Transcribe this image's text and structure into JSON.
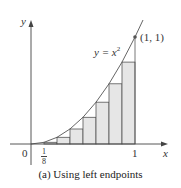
{
  "figure": {
    "function_label": "y = x",
    "exponent": "2",
    "point_label": "(1, 1)",
    "y_axis_label": "y",
    "x_axis_label": "x",
    "origin_label": "0",
    "tick_one": "1",
    "tick_eighth_num": "1",
    "tick_eighth_den": "8",
    "caption": "(a) Using left endpoints"
  },
  "colors": {
    "fill": "#e6e6e6",
    "stroke": "#555555",
    "curve": "#555555"
  },
  "diagram_data": {
    "function": "x^2",
    "n": 8,
    "method": "left endpoints",
    "rect_heights": [
      0,
      0.015625,
      0.0625,
      0.140625,
      0.25,
      0.390625,
      0.5625,
      0.765625
    ]
  }
}
